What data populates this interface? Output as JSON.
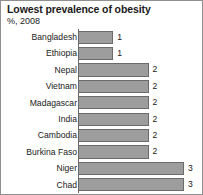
{
  "chart_data": {
    "type": "bar",
    "orientation": "horizontal",
    "title": "Lowest prevalence of obesity",
    "subtitle": "%, 2008",
    "xlabel": "",
    "ylabel": "",
    "xlim": [
      0,
      3.4
    ],
    "grid": false,
    "legend": null,
    "bar_color": "#9d9d9d",
    "bar_border_color": "#6b6b6b",
    "categories": [
      "Bangladesh",
      "Ethiopia",
      "Nepal",
      "Vietnam",
      "Madagascar",
      "India",
      "Cambodia",
      "Burkina Faso",
      "Niger",
      "Chad"
    ],
    "values": [
      1,
      1,
      2,
      2,
      2,
      2,
      2,
      2,
      3,
      3
    ],
    "value_labels": [
      "1",
      "1",
      "2",
      "2",
      "2",
      "2",
      "2",
      "2",
      "3",
      "3"
    ]
  }
}
